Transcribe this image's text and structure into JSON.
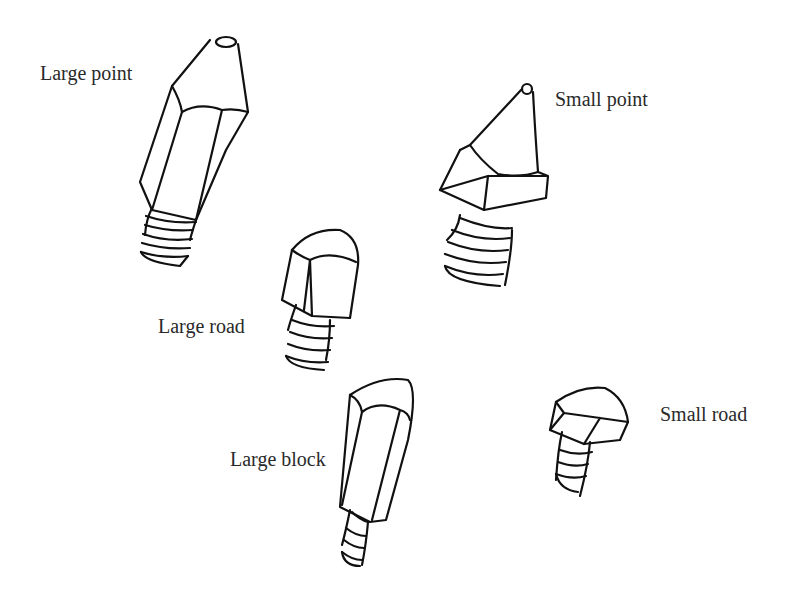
{
  "diagram": {
    "background": "#ffffff",
    "line_color": "#111111",
    "labels": [
      {
        "id": "large-point",
        "text": "Large point"
      },
      {
        "id": "small-point",
        "text": "Small point"
      },
      {
        "id": "large-road",
        "text": "Large road"
      },
      {
        "id": "large-block",
        "text": "Large block"
      },
      {
        "id": "small-road",
        "text": "Small road"
      }
    ]
  }
}
